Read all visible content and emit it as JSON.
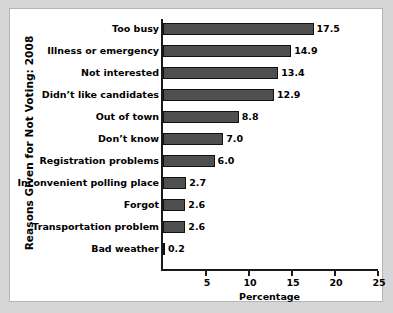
{
  "chart_data": {
    "type": "bar",
    "orientation": "horizontal",
    "title": "",
    "xlabel": "Percentage",
    "ylabel": "Reasons Given for Not Voting: 2008",
    "xlim": [
      0,
      25
    ],
    "xticks": [
      5,
      10,
      15,
      20,
      25
    ],
    "xtick_labels": [
      "5",
      "10",
      "15",
      "20",
      "25"
    ],
    "grid": false,
    "legend": null,
    "bar_color": "#4f4f4f",
    "bar_edge_color": "#111111",
    "background_color": "#ffffff",
    "figure_background_color": "#d6d6d6",
    "categories": [
      "Too busy",
      "Illness or emergency",
      "Not interested",
      "Didn’t like candidates",
      "Out of town",
      "Don’t know",
      "Registration problems",
      "Inconvenient polling place",
      "Forgot",
      "Transportation problem",
      "Bad weather"
    ],
    "values": [
      17.5,
      14.9,
      13.4,
      12.9,
      8.8,
      7.0,
      6.0,
      2.7,
      2.6,
      2.6,
      0.2
    ],
    "data_labels": [
      "17.5",
      "14.9",
      "13.4",
      "12.9",
      "8.8",
      "7.0",
      "6.0",
      "2.7",
      "2.6",
      "2.6",
      "0.2"
    ]
  }
}
